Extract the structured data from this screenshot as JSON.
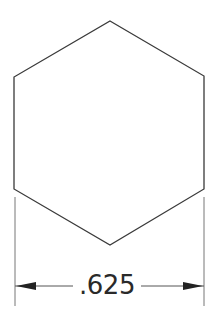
{
  "drawing": {
    "shape": "hexagon",
    "dimension": {
      "value": ".625",
      "orientation": "horizontal",
      "measured": "across-corners width"
    },
    "colors": {
      "background": "#ffffff",
      "line": "#3a3a3a",
      "dimension_line": "#555555",
      "text": "#2a2a2a"
    }
  }
}
